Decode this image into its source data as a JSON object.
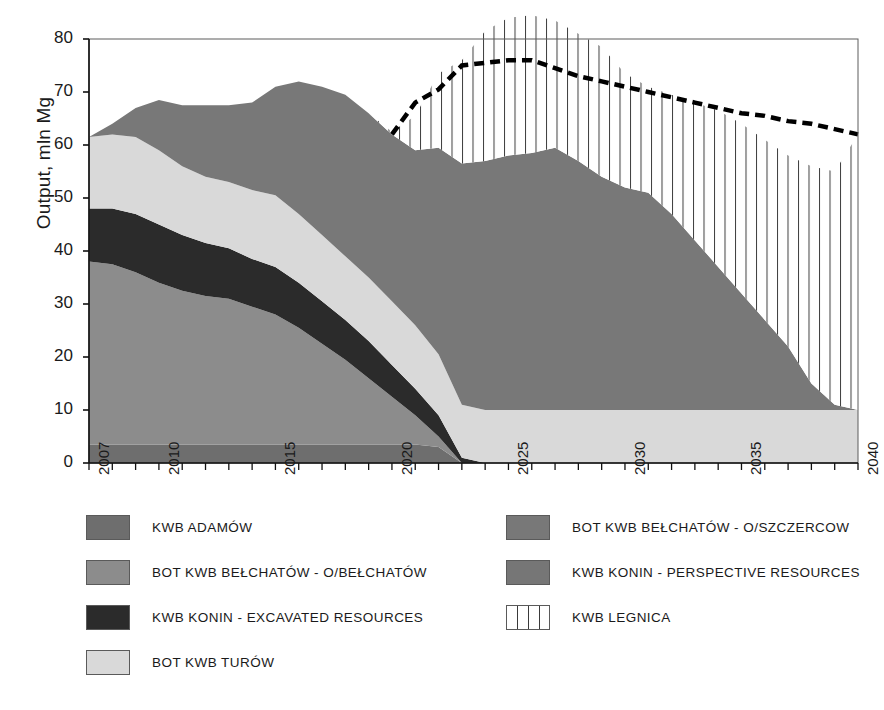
{
  "chart_data": {
    "type": "area",
    "title": "",
    "xlabel": "",
    "ylabel": "Output, mln Mg",
    "xlim": [
      2007,
      2040
    ],
    "ylim": [
      0,
      80
    ],
    "grid": false,
    "legend_position": "bottom",
    "stacked": true,
    "x": [
      2007,
      2008,
      2009,
      2010,
      2011,
      2012,
      2013,
      2014,
      2015,
      2016,
      2017,
      2018,
      2019,
      2020,
      2021,
      2022,
      2023,
      2024,
      2025,
      2026,
      2027,
      2028,
      2029,
      2030,
      2031,
      2032,
      2033,
      2034,
      2035,
      2036,
      2037,
      2038,
      2039,
      2040
    ],
    "y_ticks": [
      0,
      10,
      20,
      30,
      40,
      50,
      60,
      70,
      80
    ],
    "x_tick_labels": [
      "2007",
      "2010",
      "2015",
      "2020",
      "2025",
      "2030",
      "2035",
      "2040"
    ],
    "x_tick_values": [
      2007,
      2010,
      2015,
      2020,
      2025,
      2030,
      2035,
      2040
    ],
    "series": [
      {
        "name": "KWB ADAMÓW",
        "color": "#6e6e6e",
        "values": [
          3.5,
          3.5,
          3.5,
          3.5,
          3.5,
          3.5,
          3.5,
          3.5,
          3.5,
          3.5,
          3.5,
          3.5,
          3.5,
          3.5,
          3.5,
          3.0,
          0.0,
          0.0,
          0.0,
          0.0,
          0.0,
          0.0,
          0.0,
          0.0,
          0.0,
          0.0,
          0.0,
          0.0,
          0.0,
          0.0,
          0.0,
          0.0,
          0.0,
          0.0
        ]
      },
      {
        "name": "BOT KWB BEŁCHATÓW - O/BEŁCHATÓW",
        "color": "#8c8c8c",
        "values": [
          34.5,
          34.0,
          32.5,
          30.5,
          29.0,
          28.0,
          27.5,
          26.0,
          24.5,
          22.0,
          19.0,
          16.0,
          12.5,
          9.0,
          5.5,
          2.0,
          0.0,
          0.0,
          0.0,
          0.0,
          0.0,
          0.0,
          0.0,
          0.0,
          0.0,
          0.0,
          0.0,
          0.0,
          0.0,
          0.0,
          0.0,
          0.0,
          0.0,
          0.0
        ]
      },
      {
        "name": "KWB KONIN - EXCAVATED RESOURCES",
        "color": "#2b2b2b",
        "values": [
          10.0,
          10.5,
          11.0,
          11.0,
          10.5,
          10.0,
          9.5,
          9.0,
          9.0,
          8.5,
          8.0,
          7.5,
          7.0,
          6.0,
          5.0,
          4.0,
          1.0,
          0.0,
          0.0,
          0.0,
          0.0,
          0.0,
          0.0,
          0.0,
          0.0,
          0.0,
          0.0,
          0.0,
          0.0,
          0.0,
          0.0,
          0.0,
          0.0,
          0.0
        ]
      },
      {
        "name": "BOT KWB TURÓW",
        "color": "#d9d9d9",
        "values": [
          13.5,
          14.0,
          14.5,
          14.0,
          13.0,
          12.5,
          12.5,
          13.0,
          13.5,
          13.0,
          12.5,
          12.0,
          12.0,
          12.0,
          12.0,
          11.5,
          10.0,
          10.0,
          10.0,
          10.0,
          10.0,
          10.0,
          10.0,
          10.0,
          10.0,
          10.0,
          10.0,
          10.0,
          10.0,
          10.0,
          10.0,
          10.0,
          10.0,
          10.0
        ]
      },
      {
        "name": "BOT KWB BEŁCHATÓW - O/SZCZERCOW",
        "color": "#787878",
        "values": [
          0.0,
          2.0,
          5.5,
          9.5,
          11.5,
          13.5,
          14.5,
          16.5,
          20.5,
          25.0,
          28.0,
          30.5,
          31.0,
          31.5,
          33.0,
          39.0,
          45.5,
          47.0,
          48.0,
          48.5,
          49.5,
          47.0,
          44.0,
          42.0,
          41.0,
          37.0,
          32.0,
          27.0,
          22.0,
          17.0,
          12.0,
          5.0,
          1.0,
          0.0
        ]
      },
      {
        "name": "KWB KONIN - PERSPECTIVE RESOURCES",
        "color": "#767676",
        "values": [
          0.0,
          0.0,
          0.0,
          0.0,
          0.0,
          0.0,
          0.0,
          0.0,
          0.0,
          0.0,
          0.0,
          0.0,
          0.0,
          0.0,
          0.0,
          0.0,
          0.0,
          0.0,
          0.0,
          0.0,
          0.0,
          0.0,
          0.0,
          0.0,
          0.0,
          0.0,
          0.0,
          0.0,
          0.0,
          0.0,
          0.0,
          0.0,
          0.0,
          0.0
        ]
      },
      {
        "name": "KWB LEGNICA",
        "color": "#ffffff",
        "hatch": "vertical",
        "values": [
          0.0,
          0.0,
          0.0,
          0.0,
          0.0,
          0.0,
          0.0,
          0.0,
          0.0,
          0.0,
          0.0,
          0.0,
          0.0,
          0.5,
          6.5,
          14.0,
          19.5,
          24.5,
          26.0,
          26.0,
          24.0,
          24.0,
          24.5,
          21.5,
          20.0,
          22.5,
          26.0,
          29.5,
          32.0,
          34.0,
          36.0,
          41.0,
          44.0,
          52.0
        ]
      }
    ],
    "total_line": {
      "name": "total output incl. KWB LEGNICA",
      "style": "dashed",
      "color": "#000000",
      "x": [
        2020,
        2021,
        2022,
        2023,
        2024,
        2025,
        2026,
        2027,
        2028,
        2029,
        2030,
        2031,
        2032,
        2033,
        2034,
        2035,
        2036,
        2037,
        2038,
        2039,
        2040
      ],
      "values": [
        62.0,
        68.0,
        70.5,
        75.0,
        75.5,
        76.0,
        76.0,
        74.5,
        73.0,
        72.0,
        71.0,
        70.0,
        69.0,
        68.0,
        67.0,
        66.0,
        65.5,
        64.5,
        64.0,
        63.0,
        62.0
      ]
    },
    "stack_tops_2007": {
      "adamow": 3.5,
      "belchatow": 38.0,
      "konin_excavated": 48.0,
      "turow": 61.5
    }
  },
  "legend": {
    "left_column": [
      {
        "label": "KWB ADAMÓW",
        "color": "#6e6e6e",
        "hatch": "none"
      },
      {
        "label": "BOT KWB BEŁCHATÓW - O/BEŁCHATÓW",
        "color": "#8c8c8c",
        "hatch": "none"
      },
      {
        "label": "KWB KONIN - EXCAVATED RESOURCES",
        "color": "#2b2b2b",
        "hatch": "none"
      },
      {
        "label": "BOT KWB TURÓW",
        "color": "#d9d9d9",
        "hatch": "none"
      }
    ],
    "right_column": [
      {
        "label": "BOT KWB BEŁCHATÓW - O/SZCZERCOW",
        "color": "#787878",
        "hatch": "none"
      },
      {
        "label": "KWB KONIN - PERSPECTIVE RESOURCES",
        "color": "#767676",
        "hatch": "none"
      },
      {
        "label": "KWB LEGNICA",
        "color": "#ffffff",
        "hatch": "vertical"
      }
    ]
  },
  "axes": {
    "y_title": "Output, mln Mg",
    "y_tick_labels": [
      "0",
      "10",
      "20",
      "30",
      "40",
      "50",
      "60",
      "70",
      "80"
    ],
    "x_tick_labels": [
      "2007",
      "2010",
      "2015",
      "2020",
      "2025",
      "2030",
      "2035",
      "2040"
    ]
  }
}
